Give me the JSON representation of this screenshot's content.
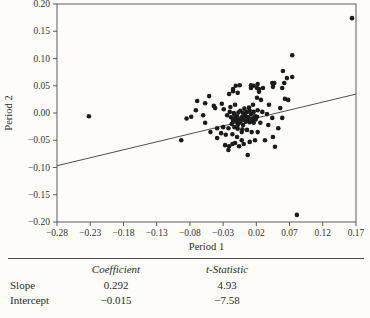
{
  "chart_data": {
    "type": "scatter",
    "title": "",
    "xlabel": "Period 1",
    "ylabel": "Period 2",
    "xlim": [
      -0.28,
      0.17
    ],
    "ylim": [
      -0.2,
      0.2
    ],
    "x_ticks": [
      -0.28,
      -0.23,
      -0.18,
      -0.13,
      -0.08,
      -0.03,
      0.02,
      0.07,
      0.12,
      0.17
    ],
    "y_ticks": [
      -0.2,
      -0.15,
      -0.1,
      -0.05,
      0.0,
      0.05,
      0.1,
      0.15,
      0.2
    ],
    "grid": false,
    "legend": "none",
    "frame_color": "#5a5a5a",
    "point_color": "#1b1b1b",
    "line_color": "#3a3a3a",
    "fit_line": {
      "slope": 0.292,
      "intercept": -0.015
    },
    "points": [
      [
        -0.232,
        -0.006
      ],
      [
        0.164,
        0.174
      ],
      [
        0.081,
        -0.187
      ],
      [
        -0.093,
        -0.05
      ],
      [
        0.074,
        0.106
      ],
      [
        0.06,
        0.077
      ],
      [
        0.066,
        0.064
      ],
      [
        0.074,
        0.066
      ],
      [
        -0.015,
        0.044
      ],
      [
        -0.011,
        0.05
      ],
      [
        0.012,
        0.051
      ],
      [
        0.016,
        0.05
      ],
      [
        0.022,
        0.053
      ],
      [
        0.044,
        0.055
      ],
      [
        0.062,
        0.055
      ],
      [
        0.012,
        0.046
      ],
      [
        0.021,
        0.046
      ],
      [
        -0.015,
        0.04
      ],
      [
        -0.021,
        0.035
      ],
      [
        -0.008,
        0.037
      ],
      [
        -0.051,
        0.031
      ],
      [
        0.047,
        0.055
      ],
      [
        0.024,
        0.039
      ],
      [
        0.03,
        0.046
      ],
      [
        0.045,
        0.048
      ],
      [
        0.059,
        0.046
      ],
      [
        0.024,
        0.044
      ],
      [
        -0.005,
        0.051
      ],
      [
        -0.069,
        0.022
      ],
      [
        -0.057,
        0.018
      ],
      [
        -0.044,
        0.013
      ],
      [
        -0.032,
        0.017
      ],
      [
        -0.029,
        0.007
      ],
      [
        -0.019,
        0.011
      ],
      [
        -0.012,
        0.015
      ],
      [
        -0.071,
        0.005
      ],
      [
        -0.06,
        -0.004
      ],
      [
        -0.078,
        -0.007
      ],
      [
        -0.085,
        -0.01
      ],
      [
        -0.057,
        -0.018
      ],
      [
        -0.042,
        0.009
      ],
      [
        -0.049,
        -0.035
      ],
      [
        -0.039,
        -0.046
      ],
      [
        0.021,
        0.028
      ],
      [
        0.027,
        0.024
      ],
      [
        0.063,
        0.026
      ],
      [
        0.068,
        0.024
      ],
      [
        0.039,
        0.015
      ],
      [
        0.056,
        0.009
      ],
      [
        0.022,
        0.005
      ],
      [
        0.029,
        0.002
      ],
      [
        0.036,
        -0.002
      ],
      [
        0.021,
        -0.007
      ],
      [
        0.044,
        -0.009
      ],
      [
        0.059,
        -0.009
      ],
      [
        0.026,
        -0.018
      ],
      [
        0.038,
        -0.022
      ],
      [
        0.053,
        -0.028
      ],
      [
        0.022,
        -0.035
      ],
      [
        0.045,
        -0.044
      ],
      [
        0.018,
        -0.05
      ],
      [
        0.048,
        -0.062
      ],
      [
        0.033,
        -0.05
      ],
      [
        -0.039,
        -0.028
      ],
      [
        -0.03,
        -0.026
      ],
      [
        -0.022,
        -0.028
      ],
      [
        -0.013,
        -0.026
      ],
      [
        -0.008,
        -0.029
      ],
      [
        -0.033,
        -0.037
      ],
      [
        -0.026,
        -0.04
      ],
      [
        -0.016,
        -0.039
      ],
      [
        -0.009,
        -0.044
      ],
      [
        -0.002,
        -0.035
      ],
      [
        0.006,
        -0.031
      ],
      [
        0.013,
        -0.035
      ],
      [
        -0.002,
        -0.05
      ],
      [
        -0.012,
        -0.055
      ],
      [
        -0.006,
        -0.061
      ],
      [
        0.001,
        -0.057
      ],
      [
        0.01,
        -0.053
      ],
      [
        0.007,
        -0.077
      ],
      [
        -0.027,
        -0.059
      ],
      [
        -0.021,
        -0.061
      ],
      [
        -0.016,
        -0.057
      ],
      [
        -0.022,
        -0.068
      ],
      [
        -0.004,
        0.004
      ],
      [
        0.0,
        0.0
      ],
      [
        0.003,
        -0.004
      ],
      [
        0.006,
        0.002
      ],
      [
        0.008,
        -0.008
      ],
      [
        0.01,
        0.004
      ],
      [
        0.012,
        -0.002
      ],
      [
        0.014,
        -0.01
      ],
      [
        0.016,
        0.002
      ],
      [
        0.018,
        -0.006
      ],
      [
        0.001,
        -0.012
      ],
      [
        0.004,
        -0.016
      ],
      [
        0.007,
        -0.013
      ],
      [
        0.01,
        -0.017
      ],
      [
        0.013,
        -0.014
      ],
      [
        0.016,
        -0.018
      ],
      [
        -0.002,
        -0.008
      ],
      [
        -0.006,
        -0.012
      ],
      [
        -0.009,
        -0.006
      ],
      [
        -0.012,
        -0.01
      ],
      [
        -0.015,
        -0.014
      ],
      [
        -0.005,
        -0.018
      ],
      [
        -0.008,
        -0.022
      ],
      [
        0.0,
        -0.022
      ],
      [
        0.019,
        -0.012
      ],
      [
        0.002,
        0.008
      ],
      [
        0.009,
        0.01
      ],
      [
        -0.001,
        -0.03
      ],
      [
        0.015,
        0.015
      ],
      [
        -0.02,
        0.002
      ],
      [
        -0.024,
        -0.004
      ],
      [
        -0.017,
        -0.02
      ],
      [
        -0.018,
        -0.008
      ],
      [
        -0.014,
        0.0
      ],
      [
        -0.01,
        -0.016
      ],
      [
        -0.013,
        -0.003
      ],
      [
        0.005,
        -0.007
      ],
      [
        -0.003,
        -0.014
      ],
      [
        0.002,
        -0.003
      ],
      [
        -0.007,
        0.001
      ]
    ]
  },
  "table": {
    "col_headers": [
      "Coefficient",
      "t-Statistic"
    ],
    "rows": [
      {
        "label": "Slope",
        "coefficient": "0.292",
        "t_statistic": "4.93"
      },
      {
        "label": "Intercept",
        "coefficient": "−0.015",
        "t_statistic": "−7.58"
      }
    ]
  }
}
